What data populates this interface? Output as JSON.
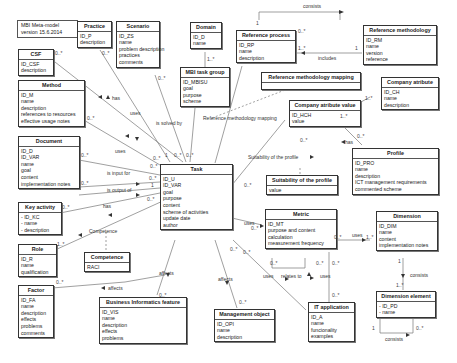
{
  "note": {
    "line1": "MBI Meta-model",
    "line2": "version 15.6.2014"
  },
  "classes": {
    "practice": {
      "title": "Practice",
      "attrs": [
        "ID_P",
        "description"
      ]
    },
    "scenario": {
      "title": "Scenario",
      "attrs": [
        "ID_ZS",
        "name",
        "problem description",
        "practices",
        "comments"
      ]
    },
    "domain": {
      "title": "Domain",
      "attrs": [
        "ID_D",
        "name"
      ]
    },
    "reference_process": {
      "title": "Reference process",
      "attrs": [
        "ID_RP",
        "name",
        "description"
      ]
    },
    "reference_methodology": {
      "title": "Reference methodology",
      "attrs": [
        "ID_RM",
        "name",
        "version",
        "reference"
      ]
    },
    "csf": {
      "title": "CSF",
      "attrs": [
        "ID_CSF",
        "description"
      ]
    },
    "mbi_task_group": {
      "title": "MBI task group",
      "attrs": [
        "ID_MBISU",
        "goal",
        "purpose",
        "scheme"
      ]
    },
    "reference_methodology_mapping": {
      "title": "Reference methodology mapping",
      "attrs": []
    },
    "company_attribute": {
      "title": "Company atribute",
      "attrs": [
        "ID_CH",
        "name",
        "description"
      ]
    },
    "company_attribute_value": {
      "title": "Company atribute value",
      "attrs": [
        "ID_HCH",
        "value"
      ]
    },
    "method": {
      "title": "Method",
      "attrs": [
        "ID_M",
        "name",
        "description",
        "references to resources",
        "effective usage notes"
      ]
    },
    "document": {
      "title": "Document",
      "attrs": [
        "ID_D",
        "ID_VAR",
        "name",
        "goal",
        "content",
        "implementation notes"
      ]
    },
    "task": {
      "title": "Task",
      "attrs": [
        "ID_U",
        "ID_VAR",
        "goal",
        "purpose",
        "content",
        "scheme of activities",
        "update date",
        "author"
      ]
    },
    "suitability_of_profile": {
      "title": "Suitability of the profile",
      "attrs": [
        "value"
      ]
    },
    "profile": {
      "title": "Profile",
      "attrs": [
        "ID_PRO",
        "name",
        "description",
        "ICT management requirements",
        "commented scheme"
      ]
    },
    "key_activity": {
      "title": "Key activity",
      "attrs": [
        "- ID_KC",
        "- name",
        "- description"
      ]
    },
    "metric": {
      "title": "Metric",
      "attrs": [
        "ID_MT",
        "purpose and content",
        "calculation",
        "measurement frequency"
      ]
    },
    "dimension": {
      "title": "Dimension",
      "attrs": [
        "ID_DIM",
        "name",
        "content",
        "implementation notes"
      ]
    },
    "role": {
      "title": "Role",
      "attrs": [
        "ID_R",
        "name",
        "qualification"
      ]
    },
    "competence": {
      "title": "Competence",
      "attrs": [
        "RACI"
      ]
    },
    "factor": {
      "title": "Factor",
      "attrs": [
        "ID_FA",
        "name",
        "description",
        "effects",
        "problems",
        "comments"
      ]
    },
    "business_informatics_feature": {
      "title": "Business Informatics feature",
      "attrs": [
        "ID_VIS",
        "name",
        "description",
        "effects",
        "problems"
      ]
    },
    "management_object": {
      "title": "Management object",
      "attrs": [
        "ID_OPI",
        "name",
        "description"
      ]
    },
    "it_application": {
      "title": "IT application",
      "attrs": [
        "ID_A",
        "name",
        "funcionality",
        "examples"
      ]
    },
    "dimension_element": {
      "title": "Dimension element",
      "attrs": [
        "- ID_PD",
        "- name"
      ]
    }
  },
  "relations": {
    "consists_rp": "consists",
    "includes": "includes",
    "has_method": "has",
    "uses_practice": "uses",
    "is_solved_by": "is solved by",
    "ref_meth_mapping": "Reference methodology mapping",
    "uses_document": "uses",
    "is_input_for": "is input for",
    "is_output_of": "is output of",
    "has_key": "has",
    "competence": "Competence",
    "suitability": "Suitability of the profile",
    "has_profile": "has",
    "uses_metric": "uses",
    "uses_dim": "uses",
    "affects_factor": "affects",
    "affects_bif": "affects",
    "affects_mo": "affects",
    "uses_it": "uses",
    "relates_to": "relates to",
    "uses_it2": "uses",
    "consists_dim": "consists",
    "consists_de": "consists"
  },
  "multiplicities": {
    "m0": "0..*",
    "m1": "1",
    "m1s": "1..*"
  }
}
